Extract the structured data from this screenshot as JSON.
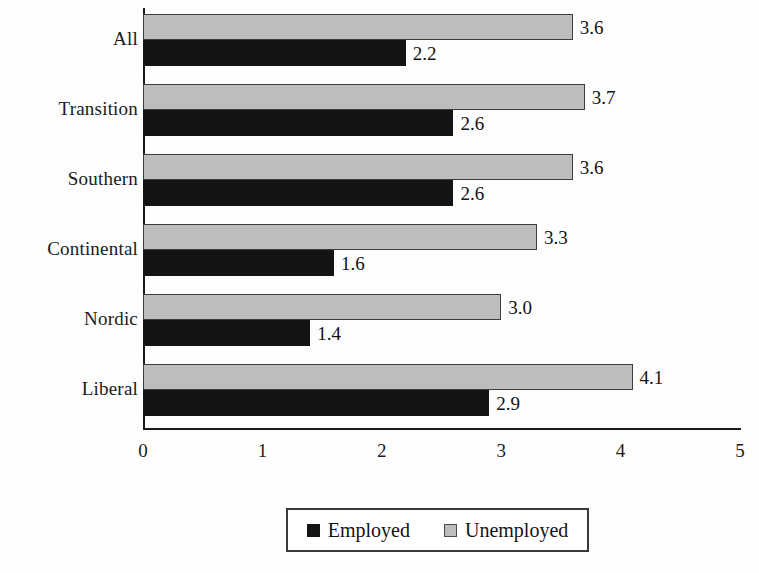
{
  "chart_data": {
    "type": "bar",
    "orientation": "horizontal",
    "title": "",
    "xlabel": "",
    "ylabel": "",
    "xlim": [
      0,
      5
    ],
    "xticks": [
      "0",
      "1",
      "2",
      "3",
      "4",
      "5"
    ],
    "grid": false,
    "legend_position": "bottom-center",
    "categories": [
      "All",
      "Transition",
      "Southern",
      "Continental",
      "Nordic",
      "Liberal"
    ],
    "series": [
      {
        "name": "Employed",
        "color": "#141414",
        "values": [
          2.2,
          2.6,
          2.6,
          1.6,
          1.4,
          2.9
        ],
        "labels": [
          "2.2",
          "2.6",
          "2.6",
          "1.6",
          "1.4",
          "2.9"
        ]
      },
      {
        "name": "Unemployed",
        "color": "#bdbdbd",
        "values": [
          3.6,
          3.7,
          3.6,
          3.3,
          3.0,
          4.1
        ],
        "labels": [
          "3.6",
          "3.7",
          "3.6",
          "3.3",
          "3.0",
          "4.1"
        ]
      }
    ]
  },
  "legend": {
    "entries": [
      {
        "label": "Employed",
        "swatch": "black-square-icon"
      },
      {
        "label": "Unemployed",
        "swatch": "gray-square-icon"
      }
    ]
  }
}
